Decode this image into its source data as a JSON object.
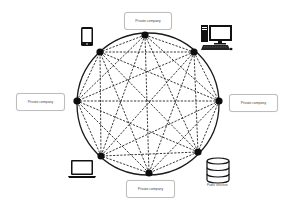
{
  "diagram": {
    "type": "fully-connected peer network (blockchain/distributed ledger)",
    "circle": {
      "cx": 148,
      "cy": 104,
      "r": 71,
      "stroke": "#1a1a1a"
    },
    "edge_style": {
      "stroke": "#222222",
      "dash": "2.2,1.4"
    },
    "nodes": [
      {
        "id": "n0",
        "x": 145,
        "y": 35
      },
      {
        "id": "n1",
        "x": 194,
        "y": 52
      },
      {
        "id": "n2",
        "x": 219,
        "y": 101
      },
      {
        "id": "n3",
        "x": 198,
        "y": 152
      },
      {
        "id": "n4",
        "x": 149,
        "y": 173
      },
      {
        "id": "n5",
        "x": 101,
        "y": 156
      },
      {
        "id": "n6",
        "x": 77,
        "y": 101
      },
      {
        "id": "n7",
        "x": 100,
        "y": 52
      }
    ],
    "labels": {
      "top": "Private company",
      "left": "Private company",
      "right": "Private company",
      "bottom": "Private company",
      "database_caption": "Public structure"
    },
    "icons": [
      {
        "name": "smartphone-icon",
        "near": "n7"
      },
      {
        "name": "desktop-computer-icon",
        "near": "n1"
      },
      {
        "name": "laptop-icon",
        "near": "n5"
      },
      {
        "name": "database-icon",
        "near": "n3"
      }
    ]
  }
}
